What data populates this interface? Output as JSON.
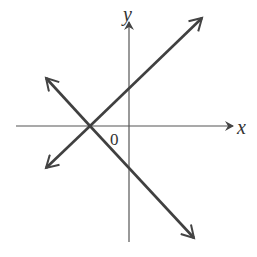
{
  "diagram": {
    "x_axis_label": "x",
    "y_axis_label": "y",
    "origin_label": "0",
    "lines": [
      {
        "name": "increasing-line",
        "slope": "positive",
        "x_intercept": "negative",
        "y_intercept": "positive"
      },
      {
        "name": "decreasing-line",
        "slope": "negative",
        "x_intercept": "negative",
        "y_intercept": "negative"
      }
    ],
    "note": "Both lines intersect on the negative x-axis",
    "colors": {
      "line": "#404040",
      "axis": "#555555"
    }
  }
}
